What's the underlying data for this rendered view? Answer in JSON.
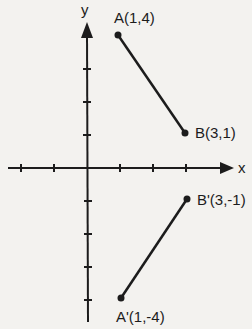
{
  "diagram": {
    "type": "coordinate-plane-reflection",
    "axes": {
      "x_label": "x",
      "y_label": "y",
      "x_ticks": [
        -2,
        -1,
        1,
        2,
        3
      ],
      "y_ticks": [
        4,
        3,
        2,
        1,
        -1,
        -2,
        -3,
        -4
      ]
    },
    "segments": [
      {
        "name": "AB",
        "start": {
          "label": "A(1,4)",
          "x": 1,
          "y": 4
        },
        "end": {
          "label": "B(3,1)",
          "x": 3,
          "y": 1
        }
      },
      {
        "name": "A'B'",
        "start": {
          "label": "A'(1,-4)",
          "x": 1,
          "y": -4
        },
        "end": {
          "label": "B'(3,-1)",
          "x": 3,
          "y": -1
        }
      }
    ],
    "colors": {
      "ink": "#1c1c1c",
      "background": "#f3f2ef"
    }
  }
}
